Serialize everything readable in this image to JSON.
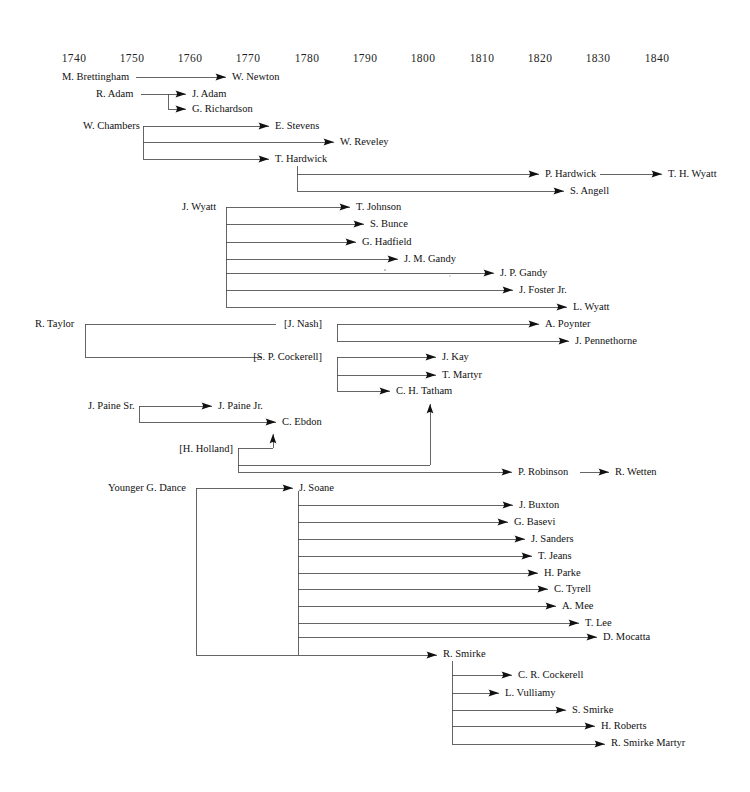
{
  "chart_data": {
    "type": "diagram",
    "subtitle": "",
    "xlabel": "",
    "ylabel": "",
    "grid": false,
    "legend_position": "none",
    "axis": {
      "name": "decade-axis",
      "range": [
        1735,
        1845
      ],
      "tick_labels": [
        "1740",
        "1750",
        "1760",
        "1770",
        "1780",
        "1790",
        "1800",
        "1810",
        "1820",
        "1830",
        "1840"
      ],
      "tick_values": [
        1740,
        1750,
        1760,
        1770,
        1780,
        1790,
        1800,
        1810,
        1820,
        1830,
        1840
      ],
      "tick_x": [
        74,
        132,
        190,
        248,
        307,
        365,
        423,
        482,
        540,
        598,
        657
      ],
      "y": 62
    },
    "colors": {
      "line": "#4a4a4a",
      "text": "#111111",
      "arrow": "#111111",
      "background": "#ffffff"
    },
    "nodes": [
      {
        "id": "m-brettingham",
        "label": "M. Brettingham",
        "x": 62,
        "y": 80,
        "anchor": "start",
        "arrow": false
      },
      {
        "id": "w-newton",
        "label": "W. Newton",
        "x": 232,
        "y": 80,
        "anchor": "start",
        "arrow": true
      },
      {
        "id": "r-adam",
        "label": "R. Adam",
        "x": 96,
        "y": 97,
        "anchor": "start",
        "arrow": false
      },
      {
        "id": "j-adam",
        "label": "J. Adam",
        "x": 192,
        "y": 97,
        "anchor": "start",
        "arrow": true
      },
      {
        "id": "g-richardson",
        "label": "G. Richardson",
        "x": 192,
        "y": 112,
        "anchor": "start",
        "arrow": true
      },
      {
        "id": "w-chambers",
        "label": "W. Chambers",
        "x": 83,
        "y": 129,
        "anchor": "start",
        "arrow": false
      },
      {
        "id": "e-stevens",
        "label": "E. Stevens",
        "x": 275,
        "y": 129,
        "anchor": "start",
        "arrow": true
      },
      {
        "id": "w-reveley",
        "label": "W. Reveley",
        "x": 340,
        "y": 145,
        "anchor": "start",
        "arrow": true
      },
      {
        "id": "t-hardwick",
        "label": "T. Hardwick",
        "x": 275,
        "y": 162,
        "anchor": "start",
        "arrow": true
      },
      {
        "id": "p-hardwick",
        "label": "P. Hardwick",
        "x": 545,
        "y": 177,
        "anchor": "start",
        "arrow": true
      },
      {
        "id": "t-h-wyatt",
        "label": "T. H. Wyatt",
        "x": 668,
        "y": 177,
        "anchor": "start",
        "arrow": true
      },
      {
        "id": "s-angell",
        "label": "S. Angell",
        "x": 570,
        "y": 194,
        "anchor": "start",
        "arrow": true
      },
      {
        "id": "j-wyatt",
        "label": "J. Wyatt",
        "x": 182,
        "y": 210,
        "anchor": "start",
        "arrow": false
      },
      {
        "id": "t-johnson",
        "label": "T. Johnson",
        "x": 356,
        "y": 210,
        "anchor": "start",
        "arrow": true
      },
      {
        "id": "s-bunce",
        "label": "S. Bunce",
        "x": 370,
        "y": 227,
        "anchor": "start",
        "arrow": true
      },
      {
        "id": "g-hadfield",
        "label": "G. Hadfield",
        "x": 362,
        "y": 245,
        "anchor": "start",
        "arrow": true
      },
      {
        "id": "j-m-gandy",
        "label": "J. M. Gandy",
        "x": 404,
        "y": 262,
        "anchor": "start",
        "arrow": true
      },
      {
        "id": "j-p-gandy",
        "label": "J. P. Gandy",
        "x": 500,
        "y": 276,
        "anchor": "start",
        "arrow": true
      },
      {
        "id": "j-foster-jr",
        "label": "J. Foster Jr.",
        "x": 519,
        "y": 293,
        "anchor": "start",
        "arrow": true
      },
      {
        "id": "l-wyatt",
        "label": "L. Wyatt",
        "x": 573,
        "y": 310,
        "anchor": "start",
        "arrow": true
      },
      {
        "id": "r-taylor",
        "label": "R. Taylor",
        "x": 35,
        "y": 327,
        "anchor": "start",
        "arrow": false
      },
      {
        "id": "j-nash",
        "label": "[J. Nash]",
        "x": 322,
        "y": 327,
        "anchor": "end",
        "arrow": false
      },
      {
        "id": "a-poynter",
        "label": "A. Poynter",
        "x": 545,
        "y": 327,
        "anchor": "start",
        "arrow": true
      },
      {
        "id": "j-pennethorne",
        "label": "J. Pennethorne",
        "x": 575,
        "y": 344,
        "anchor": "start",
        "arrow": true
      },
      {
        "id": "s-p-cockerell",
        "label": "[S. P. Cockerell]",
        "x": 322,
        "y": 360,
        "anchor": "end",
        "arrow": false
      },
      {
        "id": "j-kay",
        "label": "J. Kay",
        "x": 442,
        "y": 360,
        "anchor": "start",
        "arrow": true
      },
      {
        "id": "t-martyr",
        "label": "T. Martyr",
        "x": 442,
        "y": 378,
        "anchor": "start",
        "arrow": true
      },
      {
        "id": "c-h-tatham",
        "label": "C. H. Tatham",
        "x": 396,
        "y": 394,
        "anchor": "start",
        "arrow": true
      },
      {
        "id": "j-paine-sr",
        "label": "J. Paine Sr.",
        "x": 88,
        "y": 409,
        "anchor": "start",
        "arrow": false
      },
      {
        "id": "j-paine-jr",
        "label": "J. Paine Jr.",
        "x": 218,
        "y": 409,
        "anchor": "start",
        "arrow": true
      },
      {
        "id": "c-ebdon",
        "label": "C.  Ebdon",
        "x": 282,
        "y": 425,
        "anchor": "start",
        "arrow": true
      },
      {
        "id": "h-holland",
        "label": "[H. Holland]",
        "x": 233,
        "y": 452,
        "anchor": "end",
        "arrow": false
      },
      {
        "id": "p-robinson",
        "label": "P. Robinson",
        "x": 518,
        "y": 475,
        "anchor": "start",
        "arrow": true
      },
      {
        "id": "r-wetten",
        "label": "R. Wetten",
        "x": 615,
        "y": 475,
        "anchor": "start",
        "arrow": true
      },
      {
        "id": "younger-g-dance",
        "label": "Younger G. Dance",
        "x": 108,
        "y": 491,
        "anchor": "start",
        "arrow": false
      },
      {
        "id": "j-soane",
        "label": "J. Soane",
        "x": 299,
        "y": 491,
        "anchor": "start",
        "arrow": true
      },
      {
        "id": "j-buxton",
        "label": "J. Buxton",
        "x": 519,
        "y": 508,
        "anchor": "start",
        "arrow": true
      },
      {
        "id": "g-basevi",
        "label": "G. Basevi",
        "x": 514,
        "y": 525,
        "anchor": "start",
        "arrow": true
      },
      {
        "id": "j-sanders",
        "label": "J. Sanders",
        "x": 531,
        "y": 542,
        "anchor": "start",
        "arrow": true
      },
      {
        "id": "t-jeans",
        "label": "T. Jeans",
        "x": 538,
        "y": 559,
        "anchor": "start",
        "arrow": true
      },
      {
        "id": "h-parke",
        "label": "H. Parke",
        "x": 544,
        "y": 576,
        "anchor": "start",
        "arrow": true
      },
      {
        "id": "c-tyrell",
        "label": "C. Tyrell",
        "x": 554,
        "y": 592,
        "anchor": "start",
        "arrow": true
      },
      {
        "id": "a-mee",
        "label": "A. Mee",
        "x": 562,
        "y": 609,
        "anchor": "start",
        "arrow": true
      },
      {
        "id": "t-lee",
        "label": "T. Lee",
        "x": 585,
        "y": 626,
        "anchor": "start",
        "arrow": true
      },
      {
        "id": "d-mocatta",
        "label": "D. Mocatta",
        "x": 603,
        "y": 640,
        "anchor": "start",
        "arrow": true
      },
      {
        "id": "r-smirke",
        "label": "R. Smirke",
        "x": 443,
        "y": 657,
        "anchor": "start",
        "arrow": true
      },
      {
        "id": "c-r-cockerell",
        "label": "C. R. Cockerell",
        "x": 518,
        "y": 678,
        "anchor": "start",
        "arrow": true
      },
      {
        "id": "l-vulliamy",
        "label": "L. Vulliamy",
        "x": 505,
        "y": 696,
        "anchor": "start",
        "arrow": true
      },
      {
        "id": "s-smirke",
        "label": "S. Smirke",
        "x": 572,
        "y": 713,
        "anchor": "start",
        "arrow": true
      },
      {
        "id": "h-roberts",
        "label": "H. Roberts",
        "x": 601,
        "y": 729,
        "anchor": "start",
        "arrow": true
      },
      {
        "id": "r-smirke-martyr",
        "label": "R. Smirke Martyr",
        "x": 611,
        "y": 746,
        "anchor": "start",
        "arrow": true
      }
    ],
    "edges": [
      {
        "from": "m-brettingham",
        "to": "w-newton",
        "path": "M 136,77 L 226,77"
      },
      {
        "from": "r-adam",
        "to": "j-adam",
        "path": "M 141,94 L 168,94 L 168,94 L 186,94"
      },
      {
        "from": "r-adam-bus",
        "to": "g-richardson",
        "path": "M 168,94 L 168,109 L 186,109"
      },
      {
        "from": "w-chambers",
        "to": "e-stevens",
        "path": "M 143,126 L 269,126"
      },
      {
        "from": "w-chambers-bus",
        "to": "w-reveley",
        "path": "M 143,126 L 143,159"
      },
      {
        "from": "w-chambers-b2",
        "to": "w-reveley",
        "path": "M 143,142 L 334,142"
      },
      {
        "from": "w-chambers-b3",
        "to": "t-hardwick",
        "path": "M 143,159 L 269,159"
      },
      {
        "from": "t-hardwick-bus",
        "to": "p-hardwick",
        "path": "M 297,166 L 297,191"
      },
      {
        "from": "t-hardwick-b1",
        "to": "p-hardwick",
        "path": "M 297,174 L 539,174"
      },
      {
        "from": "t-hardwick-b2",
        "to": "s-angell",
        "path": "M 297,191 L 564,191"
      },
      {
        "from": "p-hardwick",
        "to": "t-h-wyatt",
        "path": "M 600,174 L 662,174"
      },
      {
        "from": "j-wyatt-bus",
        "to": "j-wyatt-children",
        "path": "M 226,207 L 226,307"
      },
      {
        "from": "j-wyatt",
        "to": "t-johnson",
        "path": "M 226,207 L 350,207"
      },
      {
        "from": "j-wyatt",
        "to": "s-bunce",
        "path": "M 226,224 L 364,224"
      },
      {
        "from": "j-wyatt",
        "to": "g-hadfield",
        "path": "M 226,242 L 356,242"
      },
      {
        "from": "j-wyatt",
        "to": "j-m-gandy",
        "path": "M 226,259 L 398,259"
      },
      {
        "from": "j-wyatt",
        "to": "j-p-gandy",
        "path": "M 226,273 L 494,273"
      },
      {
        "from": "j-wyatt",
        "to": "j-foster-jr",
        "path": "M 226,290 L 513,290"
      },
      {
        "from": "j-wyatt",
        "to": "l-wyatt",
        "path": "M 226,307 L 567,307"
      },
      {
        "from": "r-taylor-bus",
        "to": "taylor-children",
        "path": "M 85,324 L 85,357"
      },
      {
        "from": "r-taylor",
        "to": "j-nash",
        "path": "M 85,324 L 276,324"
      },
      {
        "from": "r-taylor",
        "to": "s-p-cockerell",
        "path": "M 85,357 L 262,357"
      },
      {
        "from": "j-nash-bus",
        "to": "nash-children",
        "path": "M 337,324 L 337,341"
      },
      {
        "from": "j-nash",
        "to": "a-poynter",
        "path": "M 337,324 L 539,324"
      },
      {
        "from": "j-nash",
        "to": "j-pennethorne",
        "path": "M 337,341 L 569,341"
      },
      {
        "from": "cockerell-bus",
        "to": "cockerell-children",
        "path": "M 337,357 L 337,391"
      },
      {
        "from": "s-p-cockerell",
        "to": "j-kay",
        "path": "M 337,357 L 436,357"
      },
      {
        "from": "s-p-cockerell",
        "to": "t-martyr",
        "path": "M 337,375 L 436,375"
      },
      {
        "from": "s-p-cockerell",
        "to": "c-h-tatham",
        "path": "M 337,391 L 390,391"
      },
      {
        "from": "j-paine-sr",
        "to": "j-paine-jr",
        "path": "M 139,406 L 212,406"
      },
      {
        "from": "paine-bus",
        "to": "c-ebdon",
        "path": "M 139,406 L 139,422 L 276,422"
      },
      {
        "from": "h-holland",
        "to": "c-ebdon-up",
        "path": "M 238,448 L 273,448 L 273,434"
      },
      {
        "from": "h-holland",
        "to": "tatham-up",
        "path": "M 238,448 L 238,465 L 430,465 L 430,404"
      },
      {
        "from": "h-holland",
        "to": "p-robinson",
        "path": "M 238,465 L 238,472 L 512,472"
      },
      {
        "from": "p-robinson",
        "to": "r-wetten",
        "path": "M 580,472 L 609,472"
      },
      {
        "from": "dance-bus",
        "to": "dance-children",
        "path": "M 196,488 L 196,655"
      },
      {
        "from": "younger-g-dance",
        "to": "j-soane",
        "path": "M 196,488 L 293,488"
      },
      {
        "from": "soane-bus",
        "to": "soane-children",
        "path": "M 298,491 L 298,655"
      },
      {
        "from": "j-soane",
        "to": "j-buxton",
        "path": "M 298,505 L 513,505"
      },
      {
        "from": "j-soane",
        "to": "g-basevi",
        "path": "M 298,522 L 508,522"
      },
      {
        "from": "j-soane",
        "to": "j-sanders",
        "path": "M 298,539 L 525,539"
      },
      {
        "from": "j-soane",
        "to": "t-jeans",
        "path": "M 298,556 L 532,556"
      },
      {
        "from": "j-soane",
        "to": "h-parke",
        "path": "M 298,573 L 538,573"
      },
      {
        "from": "j-soane",
        "to": "c-tyrell",
        "path": "M 298,589 L 548,589"
      },
      {
        "from": "j-soane",
        "to": "a-mee",
        "path": "M 298,606 L 556,606"
      },
      {
        "from": "j-soane",
        "to": "t-lee",
        "path": "M 298,623 L 579,623"
      },
      {
        "from": "j-soane",
        "to": "d-mocatta",
        "path": "M 298,637 L 597,637"
      },
      {
        "from": "dance-soane",
        "to": "r-smirke",
        "path": "M 196,655 L 437,655"
      },
      {
        "from": "smirke-bus",
        "to": "smirke-children",
        "path": "M 452,661 L 452,744"
      },
      {
        "from": "r-smirke",
        "to": "c-r-cockerell",
        "path": "M 452,675 L 512,675"
      },
      {
        "from": "r-smirke",
        "to": "l-vulliamy",
        "path": "M 452,693 L 499,693"
      },
      {
        "from": "r-smirke",
        "to": "s-smirke",
        "path": "M 452,710 L 566,710"
      },
      {
        "from": "r-smirke",
        "to": "h-roberts",
        "path": "M 452,726 L 595,726"
      },
      {
        "from": "r-smirke",
        "to": "r-smirke-martyr",
        "path": "M 452,744 L 605,744"
      }
    ],
    "arrowheads": [
      {
        "for": "w-newton",
        "x": 226,
        "y": 77,
        "dir": "right"
      },
      {
        "for": "j-adam",
        "x": 186,
        "y": 94,
        "dir": "right"
      },
      {
        "for": "g-richardson",
        "x": 186,
        "y": 109,
        "dir": "right"
      },
      {
        "for": "e-stevens",
        "x": 269,
        "y": 126,
        "dir": "right"
      },
      {
        "for": "w-reveley",
        "x": 334,
        "y": 142,
        "dir": "right"
      },
      {
        "for": "t-hardwick",
        "x": 269,
        "y": 159,
        "dir": "right"
      },
      {
        "for": "p-hardwick",
        "x": 539,
        "y": 174,
        "dir": "right"
      },
      {
        "for": "t-h-wyatt",
        "x": 662,
        "y": 174,
        "dir": "right"
      },
      {
        "for": "s-angell",
        "x": 564,
        "y": 191,
        "dir": "right"
      },
      {
        "for": "t-johnson",
        "x": 350,
        "y": 207,
        "dir": "right"
      },
      {
        "for": "s-bunce",
        "x": 364,
        "y": 224,
        "dir": "right"
      },
      {
        "for": "g-hadfield",
        "x": 356,
        "y": 242,
        "dir": "right"
      },
      {
        "for": "j-m-gandy",
        "x": 398,
        "y": 259,
        "dir": "right"
      },
      {
        "for": "j-p-gandy",
        "x": 494,
        "y": 273,
        "dir": "right"
      },
      {
        "for": "j-foster-jr",
        "x": 513,
        "y": 290,
        "dir": "right"
      },
      {
        "for": "l-wyatt",
        "x": 567,
        "y": 307,
        "dir": "right"
      },
      {
        "for": "a-poynter",
        "x": 539,
        "y": 324,
        "dir": "right"
      },
      {
        "for": "j-pennethorne",
        "x": 569,
        "y": 341,
        "dir": "right"
      },
      {
        "for": "j-kay",
        "x": 436,
        "y": 357,
        "dir": "right"
      },
      {
        "for": "t-martyr",
        "x": 436,
        "y": 375,
        "dir": "right"
      },
      {
        "for": "c-h-tatham",
        "x": 390,
        "y": 391,
        "dir": "right"
      },
      {
        "for": "j-paine-jr",
        "x": 212,
        "y": 406,
        "dir": "right"
      },
      {
        "for": "c-ebdon",
        "x": 276,
        "y": 422,
        "dir": "right"
      },
      {
        "for": "c-ebdon-up",
        "x": 273,
        "y": 434,
        "dir": "up"
      },
      {
        "for": "tatham-up",
        "x": 430,
        "y": 404,
        "dir": "up"
      },
      {
        "for": "p-robinson",
        "x": 512,
        "y": 472,
        "dir": "right"
      },
      {
        "for": "r-wetten",
        "x": 609,
        "y": 472,
        "dir": "right"
      },
      {
        "for": "j-soane",
        "x": 293,
        "y": 488,
        "dir": "right"
      },
      {
        "for": "j-buxton",
        "x": 513,
        "y": 505,
        "dir": "right"
      },
      {
        "for": "g-basevi",
        "x": 508,
        "y": 522,
        "dir": "right"
      },
      {
        "for": "j-sanders",
        "x": 525,
        "y": 539,
        "dir": "right"
      },
      {
        "for": "t-jeans",
        "x": 532,
        "y": 556,
        "dir": "right"
      },
      {
        "for": "h-parke",
        "x": 538,
        "y": 573,
        "dir": "right"
      },
      {
        "for": "c-tyrell",
        "x": 548,
        "y": 589,
        "dir": "right"
      },
      {
        "for": "a-mee",
        "x": 556,
        "y": 606,
        "dir": "right"
      },
      {
        "for": "t-lee",
        "x": 579,
        "y": 623,
        "dir": "right"
      },
      {
        "for": "d-mocatta",
        "x": 597,
        "y": 637,
        "dir": "right"
      },
      {
        "for": "r-smirke",
        "x": 437,
        "y": 655,
        "dir": "right"
      },
      {
        "for": "c-r-cockerell",
        "x": 512,
        "y": 675,
        "dir": "right"
      },
      {
        "for": "l-vulliamy",
        "x": 499,
        "y": 693,
        "dir": "right"
      },
      {
        "for": "s-smirke",
        "x": 566,
        "y": 710,
        "dir": "right"
      },
      {
        "for": "h-roberts",
        "x": 595,
        "y": 726,
        "dir": "right"
      },
      {
        "for": "r-smirke-martyr",
        "x": 605,
        "y": 744,
        "dir": "right"
      }
    ],
    "specks": [
      {
        "x": 385,
        "y": 270,
        "r": 1.1
      },
      {
        "x": 450,
        "y": 276,
        "r": 0.8
      }
    ]
  }
}
